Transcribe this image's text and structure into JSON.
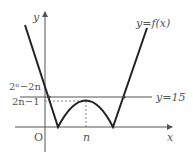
{
  "diagram": {
    "curve_label": "y=f(x)",
    "line_label": "y=15",
    "y_axis_label": "y",
    "x_axis_label": "x",
    "origin_label": "O",
    "x_tick_label": "n",
    "y_label_upper": "2ⁿ−2n",
    "y_label_lower": "2n−1",
    "colors": {
      "curve": "#222222",
      "axis": "#555555",
      "line": "#555555",
      "dashed": "#666666",
      "text": "#555555"
    }
  }
}
